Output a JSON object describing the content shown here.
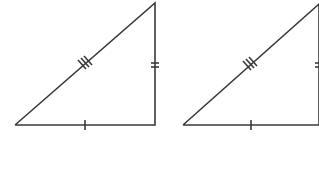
{
  "diagram": {
    "stroke_color": "#3a3a3a",
    "background": "#ffffff",
    "triangles": [
      {
        "name": "triangle-left",
        "vertices": {
          "bottom_left": [
            15,
            125
          ],
          "top_right": [
            155,
            3
          ],
          "bottom_right": [
            155,
            125
          ]
        },
        "marks": {
          "base_ticks": 1,
          "vertical_ticks": 2,
          "hypotenuse_ticks": 3
        }
      },
      {
        "name": "triangle-right",
        "vertices": {
          "bottom_left": [
            183,
            125
          ],
          "top_right": [
            319,
            4
          ],
          "bottom_right": [
            319,
            125
          ]
        },
        "marks": {
          "base_ticks": 1,
          "vertical_ticks": 2,
          "hypotenuse_ticks": 3
        }
      }
    ]
  },
  "caption": ""
}
